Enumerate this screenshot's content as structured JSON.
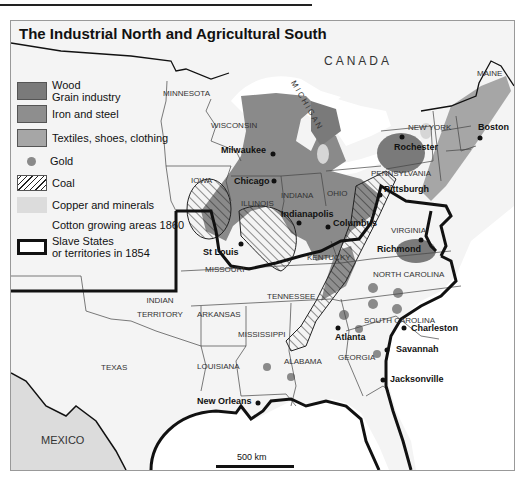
{
  "map": {
    "title": "The Industrial North and Agricultural South",
    "scale_bar": "500 km",
    "legend": [
      {
        "id": "wood",
        "label_line1": "Wood",
        "label_line2": "Grain industry",
        "swatch": "#7a7a7a"
      },
      {
        "id": "iron",
        "label": "Iron and steel",
        "swatch": "#8e8e8e"
      },
      {
        "id": "textiles",
        "label": "Textiles, shoes, clothing",
        "swatch": "#a6a6a6"
      },
      {
        "id": "gold",
        "label": "Gold",
        "swatch": "#8a8a8a"
      },
      {
        "id": "coal",
        "label": "Coal",
        "swatch": "hatch"
      },
      {
        "id": "copper",
        "label": "Copper and minerals",
        "swatch": "#d6d6d6"
      },
      {
        "id": "cotton",
        "label": "Cotton growing areas 1860",
        "swatch": "#ffffff"
      },
      {
        "id": "slave",
        "label_line1": "Slave States",
        "label_line2": "or territories in 1854",
        "swatch": "thick-border"
      }
    ],
    "regions": {
      "canada": "CANADA",
      "mexico": "MEXICO",
      "lake": "MICHIGAN"
    },
    "states": [
      "MINNESOTA",
      "WISCONSIN",
      "IOWA",
      "ILLINOIS",
      "INDIANA",
      "OHIO",
      "PENNSYLVANIA",
      "NEW YORK",
      "MAINE",
      "VIRGINIA",
      "KENTUCKY",
      "MISSOURI",
      "TENNESSEE",
      "NORTH CAROLINA",
      "SOUTH CAROLINA",
      "GEORGIA",
      "ALABAMA",
      "MISSISSIPPI",
      "LOUISIANA",
      "ARKANSAS",
      "TEXAS"
    ],
    "territory_line1": "INDIAN",
    "territory_line2": "TERRITORY",
    "cities": [
      "Milwaukee",
      "Chicago",
      "Indianapolis",
      "Columbus",
      "Pittsburgh",
      "Rochester",
      "Boston",
      "Richmond",
      "St Louis",
      "Atlanta",
      "Charleston",
      "Savannah",
      "Jacksonville",
      "New Orleans"
    ],
    "colors": {
      "industry_dark": "#7a7a7a",
      "industry_mid": "#8e8e8e",
      "textiles": "#a6a6a6",
      "copper": "#d6d6d6",
      "land": "#f4f4f4",
      "water": "#ffffff",
      "border": "#111111"
    }
  }
}
